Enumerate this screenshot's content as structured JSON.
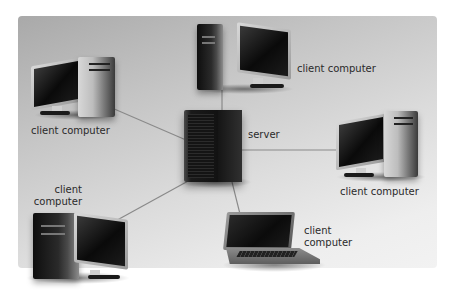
{
  "diagram": {
    "title": "",
    "type": "client-server network",
    "colors": {
      "panel_top_left": "#a9a9a9",
      "panel_bottom_right": "#f2f2f2",
      "link_line": "#8a8a8a",
      "label_text": "#2a2a2a"
    },
    "nodes": [
      {
        "id": "server",
        "kind": "server",
        "label": "server"
      },
      {
        "id": "client-top",
        "kind": "desktop",
        "label": "client computer"
      },
      {
        "id": "client-left",
        "kind": "desktop",
        "label": "client computer"
      },
      {
        "id": "client-right",
        "kind": "desktop",
        "label": "client computer"
      },
      {
        "id": "client-bottom-left",
        "kind": "desktop",
        "label_line1": "client",
        "label_line2": "computer"
      },
      {
        "id": "client-laptop",
        "kind": "laptop",
        "label_line1": "client",
        "label_line2": "computer"
      }
    ],
    "edges": [
      {
        "from": "server",
        "to": "client-top"
      },
      {
        "from": "server",
        "to": "client-left"
      },
      {
        "from": "server",
        "to": "client-right"
      },
      {
        "from": "server",
        "to": "client-bottom-left"
      },
      {
        "from": "server",
        "to": "client-laptop"
      }
    ]
  }
}
